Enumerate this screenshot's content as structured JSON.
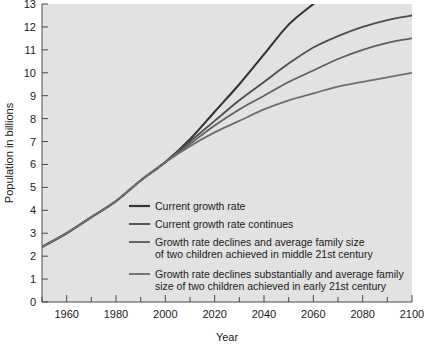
{
  "chart_data": {
    "type": "line",
    "title": "",
    "xlabel": "Year",
    "ylabel": "Population in billions",
    "xlim": [
      1950,
      2100
    ],
    "ylim": [
      0,
      13
    ],
    "grid": false,
    "legend_position": "inside-lower-left",
    "xticks": [
      1960,
      1980,
      2000,
      2020,
      2040,
      2060,
      2080,
      2100
    ],
    "xticks_minor": [
      1950,
      1970,
      1990,
      2010,
      2030,
      2050,
      2070,
      2090
    ],
    "yticks": [
      0,
      1,
      2,
      3,
      4,
      5,
      6,
      7,
      8,
      9,
      10,
      11,
      12,
      13
    ],
    "x": [
      1950,
      1960,
      1970,
      1980,
      1990,
      2000,
      2010,
      2020,
      2030,
      2040,
      2050,
      2060,
      2070,
      2080,
      2090,
      2100
    ],
    "series": [
      {
        "name": "Current growth rate",
        "color": "#333333",
        "values": [
          2.4,
          3.0,
          3.7,
          4.4,
          5.3,
          6.1,
          7.1,
          8.3,
          9.5,
          10.8,
          12.1,
          13.0,
          null,
          null,
          null,
          null
        ]
      },
      {
        "name": "Current growth rate continues",
        "color": "#4d4d4d",
        "values": [
          2.4,
          3.0,
          3.7,
          4.4,
          5.3,
          6.1,
          7.0,
          7.9,
          8.8,
          9.6,
          10.4,
          11.1,
          11.6,
          12.0,
          12.3,
          12.5
        ]
      },
      {
        "name": "Growth rate declines and average family size of two children achieved in middle 21st century",
        "color": "#5e5e5e",
        "values": [
          2.4,
          3.0,
          3.7,
          4.4,
          5.3,
          6.1,
          6.9,
          7.7,
          8.4,
          9.0,
          9.6,
          10.1,
          10.6,
          11.0,
          11.3,
          11.5
        ]
      },
      {
        "name": "Growth rate declines substantially and average family size of two children achieved in early 21st century",
        "color": "#6e6e6e",
        "values": [
          2.4,
          3.0,
          3.7,
          4.4,
          5.3,
          6.1,
          6.8,
          7.4,
          7.9,
          8.4,
          8.8,
          9.1,
          9.4,
          9.6,
          9.8,
          10.0
        ]
      }
    ]
  },
  "legend": {
    "entries": [
      {
        "line1": "Current growth rate",
        "line2": "",
        "color": "#333333"
      },
      {
        "line1": "Current growth rate continues",
        "line2": "",
        "color": "#4d4d4d"
      },
      {
        "line1": "Growth rate declines and average family size",
        "line2": "of two children achieved in middle 21st century",
        "color": "#5e5e5e"
      },
      {
        "line1": "Growth rate declines substantially and average family",
        "line2": "size of two children achieved in early 21st century",
        "color": "#6e6e6e"
      }
    ]
  },
  "style": {
    "plot_background": "#e2e2e2",
    "page_background": "#ffffff",
    "axis_color": "#4a4a4a",
    "text_color": "#1a1a1a"
  }
}
